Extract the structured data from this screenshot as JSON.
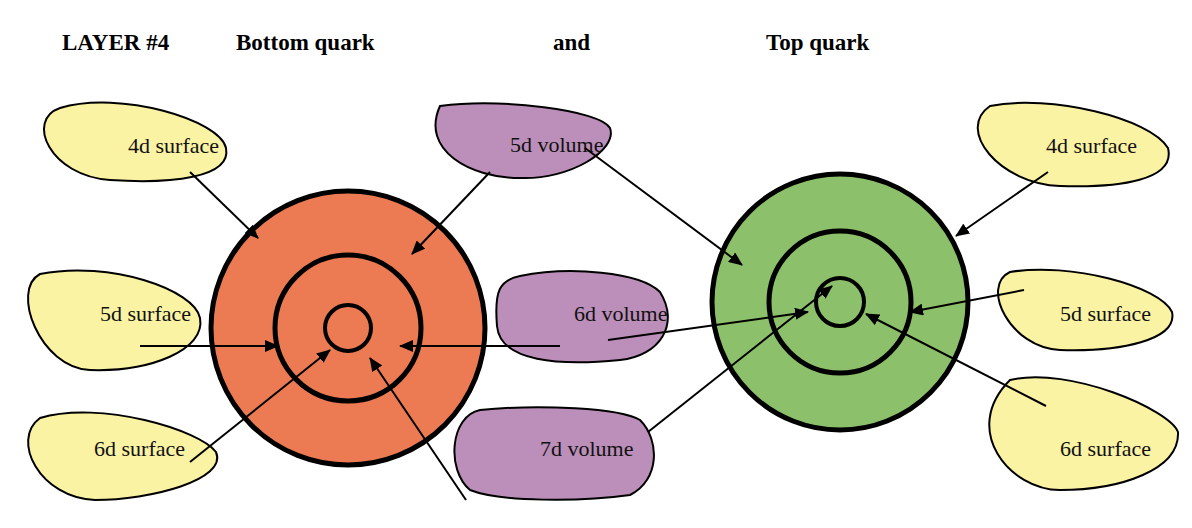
{
  "header": {
    "layer": "LAYER #4",
    "left_title": "Bottom quark",
    "conjunction": "and",
    "right_title": "Top quark"
  },
  "colors": {
    "surface_fill": "#fbf3a4",
    "volume_fill": "#bb8fb9",
    "bottom_quark_fill": "#ec7a52",
    "top_quark_fill": "#8dc06a",
    "stroke": "#000000"
  },
  "bottom_quark": {
    "cx": 348,
    "cy": 328,
    "rings": [
      {
        "r": 137,
        "w": 5
      },
      {
        "r": 73,
        "w": 5
      },
      {
        "r": 23,
        "w": 4
      }
    ]
  },
  "top_quark": {
    "cx": 840,
    "cy": 302,
    "rings": [
      {
        "r": 128,
        "w": 5
      },
      {
        "r": 71,
        "w": 5
      },
      {
        "r": 24,
        "w": 4
      }
    ]
  },
  "labels": [
    {
      "id": "left-4d-surface",
      "text": "4d surface",
      "kind": "surface",
      "x": 128,
      "y": 153,
      "path": "M 60 108 C 120 90 220 120 226 148 C 232 178 170 184 110 180 C 50 176 25 120 60 108 Z"
    },
    {
      "id": "left-5d-surface",
      "text": "5d surface",
      "kind": "surface",
      "x": 100,
      "y": 321,
      "path": "M 40 274 C 110 260 195 290 200 318 C 206 350 150 372 90 370 C 40 368 10 290 40 274 Z"
    },
    {
      "id": "left-6d-surface",
      "text": "6d surface",
      "kind": "surface",
      "x": 94,
      "y": 456,
      "path": "M 40 418 C 100 400 200 430 216 452 C 228 480 150 500 95 500 C 40 498 10 440 40 418 Z"
    },
    {
      "id": "5d-volume",
      "text": "5d volume",
      "kind": "volume",
      "x": 510,
      "y": 152,
      "path": "M 440 106 C 500 98 600 110 610 128 C 618 150 570 180 520 178 C 470 178 420 150 440 106 Z"
    },
    {
      "id": "6d-volume",
      "text": "6d volume",
      "kind": "volume",
      "x": 574,
      "y": 321,
      "path": "M 520 276 C 570 266 640 272 660 292 C 680 324 660 356 620 360 C 560 366 500 362 497 326 C 494 290 500 280 520 276 Z"
    },
    {
      "id": "7d-volume",
      "text": "7d volume",
      "kind": "volume",
      "x": 540,
      "y": 456,
      "path": "M 480 410 C 540 404 620 408 640 420 C 660 440 660 480 630 495 C 580 502 500 502 470 490 C 446 470 450 416 480 410 Z"
    },
    {
      "id": "right-4d-surface",
      "text": "4d surface",
      "kind": "surface",
      "x": 1046,
      "y": 153,
      "path": "M 990 106 C 1050 94 1150 118 1168 148 C 1176 180 1120 188 1060 186 C 1000 184 955 130 990 106 Z"
    },
    {
      "id": "right-5d-surface",
      "text": "5d surface",
      "kind": "surface",
      "x": 1060,
      "y": 321,
      "path": "M 1010 272 C 1070 262 1160 286 1172 312 C 1178 340 1120 352 1060 350 C 1010 348 980 286 1010 272 Z"
    },
    {
      "id": "right-6d-surface",
      "text": "6d surface",
      "kind": "surface",
      "x": 1060,
      "y": 456,
      "path": "M 1010 380 C 1070 366 1170 410 1178 432 C 1180 470 1120 490 1060 490 C 1010 490 960 430 1010 380 Z"
    }
  ],
  "arrows": [
    {
      "from": [
        190,
        172
      ],
      "to": [
        258,
        238
      ]
    },
    {
      "from": [
        140,
        346
      ],
      "to": [
        278,
        346
      ]
    },
    {
      "from": [
        190,
        462
      ],
      "to": [
        330,
        350
      ]
    },
    {
      "from": [
        490,
        172
      ],
      "to": [
        412,
        254
      ]
    },
    {
      "from": [
        560,
        346
      ],
      "to": [
        400,
        346
      ]
    },
    {
      "from": [
        466,
        500
      ],
      "to": [
        370,
        358
      ]
    },
    {
      "from": [
        585,
        148
      ],
      "to": [
        742,
        265
      ]
    },
    {
      "from": [
        608,
        340
      ],
      "to": [
        808,
        312
      ]
    },
    {
      "from": [
        648,
        432
      ],
      "to": [
        832,
        286
      ]
    },
    {
      "from": [
        1048,
        172
      ],
      "to": [
        956,
        236
      ]
    },
    {
      "from": [
        1024,
        290
      ],
      "to": [
        910,
        312
      ]
    },
    {
      "from": [
        1046,
        406
      ],
      "to": [
        866,
        314
      ]
    }
  ]
}
